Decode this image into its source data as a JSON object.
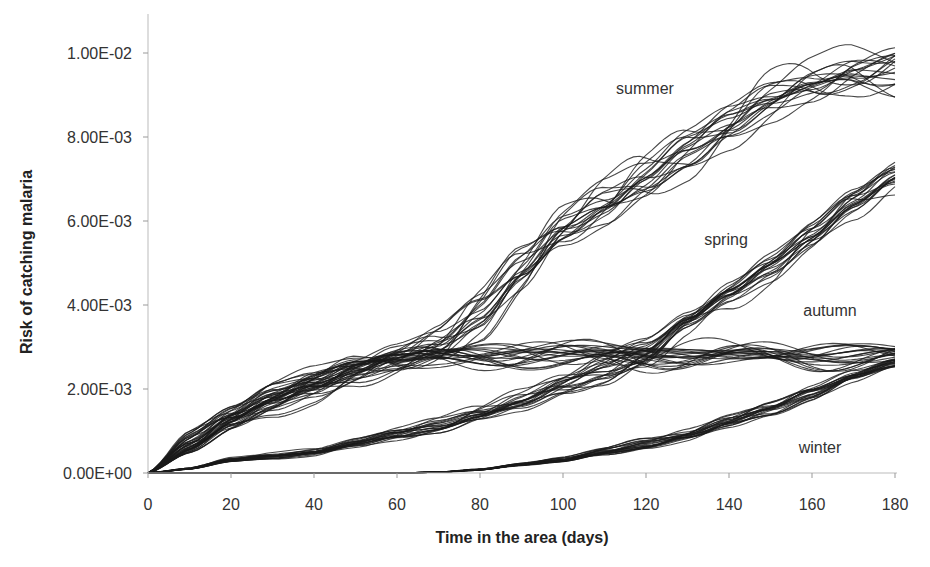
{
  "chart_data": {
    "type": "line",
    "title": "",
    "xlabel": "Time in the area (days)",
    "ylabel": "Risk of catching malaria",
    "xlim": [
      0,
      180
    ],
    "ylim": [
      0,
      0.0105
    ],
    "x_ticks": [
      0,
      20,
      40,
      60,
      80,
      100,
      120,
      140,
      160,
      180
    ],
    "x_tick_labels": [
      "0",
      "20",
      "40",
      "60",
      "80",
      "100",
      "120",
      "140",
      "160",
      "180"
    ],
    "y_ticks": [
      0,
      0.002,
      0.004,
      0.006,
      0.008,
      0.01
    ],
    "y_tick_labels": [
      "0.00E+00",
      "2.00E-03",
      "4.00E-03",
      "6.00E-03",
      "8.00E-03",
      "1.00E-02"
    ],
    "grid": false,
    "legend": "inline labels",
    "runs_per_series": 20,
    "x": [
      0,
      10,
      20,
      30,
      40,
      50,
      60,
      70,
      80,
      90,
      100,
      110,
      120,
      130,
      140,
      150,
      160,
      170,
      180
    ],
    "series": [
      {
        "name": "summer",
        "values": [
          0,
          0.0006,
          0.0012,
          0.0016,
          0.002,
          0.0024,
          0.0027,
          0.0031,
          0.0038,
          0.0048,
          0.0058,
          0.0064,
          0.007,
          0.0077,
          0.0083,
          0.0088,
          0.0092,
          0.0096,
          0.0097
        ],
        "spread": 0.0006
      },
      {
        "name": "spring",
        "values": [
          0,
          0.0001,
          0.0003,
          0.0004,
          0.0005,
          0.0007,
          0.0009,
          0.0011,
          0.0014,
          0.0017,
          0.0021,
          0.0024,
          0.0028,
          0.0036,
          0.0043,
          0.0049,
          0.0056,
          0.0064,
          0.0071
        ],
        "spread": 0.00035
      },
      {
        "name": "autumn",
        "values": [
          0,
          0.0008,
          0.0014,
          0.0019,
          0.0022,
          0.0025,
          0.0027,
          0.0028,
          0.0028,
          0.0028,
          0.0028,
          0.0028,
          0.0028,
          0.0028,
          0.0028,
          0.0028,
          0.0028,
          0.0028,
          0.0028
        ],
        "spread": 0.0003
      },
      {
        "name": "winter",
        "values": [
          0,
          0.0,
          0.0,
          0.0,
          0.0,
          0.0,
          0.0,
          2e-05,
          8e-05,
          0.0002,
          0.0003,
          0.0005,
          0.0007,
          0.0009,
          0.0012,
          0.0015,
          0.0019,
          0.0023,
          0.0026
        ],
        "spread": 0.00015
      }
    ],
    "annotations": [
      {
        "text": "summer",
        "x": 120,
        "y": 0.0092
      },
      {
        "text": "spring",
        "x": 120,
        "y": 0.0055
      },
      {
        "text": "autumn",
        "x": 160,
        "y": 0.0038
      },
      {
        "text": "winter",
        "x": 160,
        "y": 0.0006
      }
    ]
  }
}
